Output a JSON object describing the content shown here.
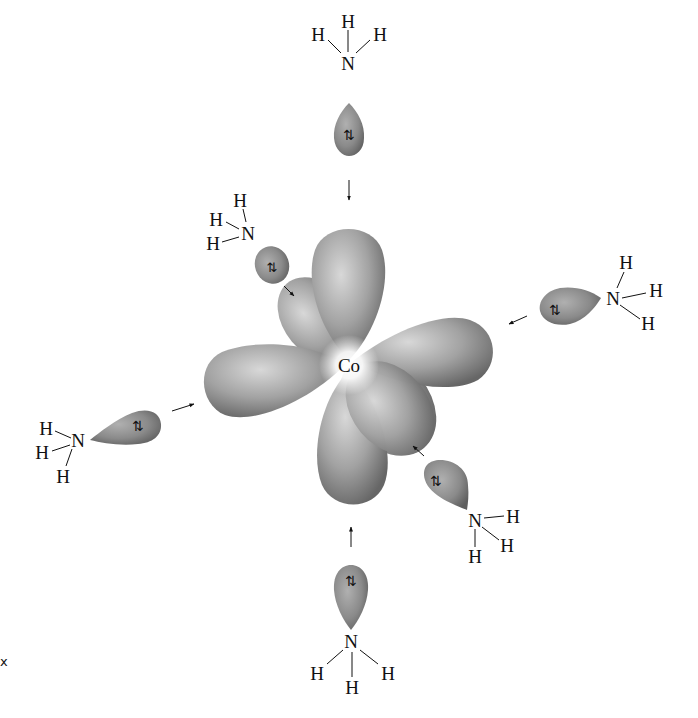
{
  "diagram": {
    "type": "octahedral ligand field / orbital overlap diagram",
    "central_atom": {
      "label": "Co",
      "x": 349,
      "y": 365
    },
    "axis_label": "x",
    "colors": {
      "orbital_light": "#d2d2d2",
      "orbital_dark": "#6f6f6f",
      "center_glow": "#ffffff",
      "text": "#111111"
    },
    "ligands": [
      {
        "id": "top",
        "formula": "NH3",
        "atoms": [
          {
            "label": "H",
            "x": 348,
            "y": 21
          },
          {
            "label": "H",
            "x": 318,
            "y": 34
          },
          {
            "label": "H",
            "x": 380,
            "y": 34
          },
          {
            "label": "N",
            "x": 348,
            "y": 63
          }
        ]
      },
      {
        "id": "upper-left",
        "formula": "NH3",
        "atoms": [
          {
            "label": "H",
            "x": 240,
            "y": 200
          },
          {
            "label": "H",
            "x": 216,
            "y": 219
          },
          {
            "label": "H",
            "x": 213,
            "y": 243
          },
          {
            "label": "N",
            "x": 248,
            "y": 233
          }
        ]
      },
      {
        "id": "right",
        "formula": "NH3",
        "atoms": [
          {
            "label": "H",
            "x": 626,
            "y": 262
          },
          {
            "label": "N",
            "x": 613,
            "y": 298
          },
          {
            "label": "H",
            "x": 656,
            "y": 290
          },
          {
            "label": "H",
            "x": 648,
            "y": 323
          }
        ]
      },
      {
        "id": "left",
        "formula": "NH3",
        "atoms": [
          {
            "label": "H",
            "x": 46,
            "y": 428
          },
          {
            "label": "N",
            "x": 78,
            "y": 440
          },
          {
            "label": "H",
            "x": 42,
            "y": 452
          },
          {
            "label": "H",
            "x": 63,
            "y": 476
          }
        ]
      },
      {
        "id": "lower-right",
        "formula": "NH3",
        "atoms": [
          {
            "label": "N",
            "x": 475,
            "y": 520
          },
          {
            "label": "H",
            "x": 513,
            "y": 516
          },
          {
            "label": "H",
            "x": 507,
            "y": 545
          },
          {
            "label": "H",
            "x": 475,
            "y": 556
          }
        ]
      },
      {
        "id": "bottom",
        "formula": "NH3",
        "atoms": [
          {
            "label": "N",
            "x": 351,
            "y": 641
          },
          {
            "label": "H",
            "x": 317,
            "y": 673
          },
          {
            "label": "H",
            "x": 352,
            "y": 687
          },
          {
            "label": "H",
            "x": 388,
            "y": 673
          }
        ]
      }
    ],
    "electron_pair_symbol": "⇅",
    "lone_pair_label": "lone pair (2 e⁻)"
  }
}
